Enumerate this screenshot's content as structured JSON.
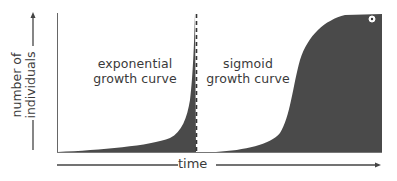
{
  "figure": {
    "panels": [
      {
        "id": "left",
        "label_line1": "exponential",
        "label_line2": "growth curve"
      },
      {
        "id": "right",
        "label_line1": "sigmoid",
        "label_line2": "growth curve"
      }
    ],
    "y_axis": {
      "label_line1": "number of",
      "label_line2": "individuals"
    },
    "x_axis": {
      "label": "time"
    },
    "colors": {
      "fill": "#4a4a4a",
      "frame": "#555555",
      "background": "#ffffff",
      "text": "#3a3a3a"
    }
  }
}
